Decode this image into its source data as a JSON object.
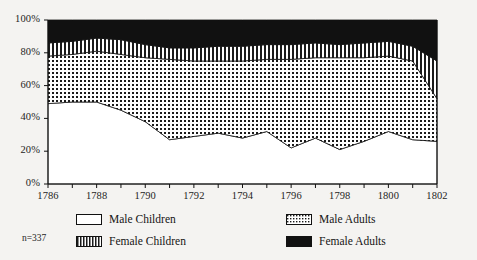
{
  "chart_data": {
    "type": "area",
    "title": "",
    "subtitle": "",
    "xlabel": "",
    "ylabel": "",
    "stacked": true,
    "normalized": true,
    "grid": false,
    "legend_position": "bottom",
    "xlim": [
      1786,
      1802
    ],
    "ylim": [
      0,
      100
    ],
    "ytick_labels": [
      "0%",
      "20%",
      "40%",
      "60%",
      "80%",
      "100%"
    ],
    "ytick_values": [
      0,
      20,
      40,
      60,
      80,
      100
    ],
    "xtick_labels": [
      "1786",
      "1788",
      "1790",
      "1792",
      "1794",
      "1796",
      "1798",
      "1800",
      "1802"
    ],
    "xtick_values": [
      1786,
      1788,
      1790,
      1792,
      1794,
      1796,
      1798,
      1800,
      1802
    ],
    "x": [
      1786,
      1787,
      1788,
      1789,
      1790,
      1791,
      1792,
      1793,
      1794,
      1795,
      1796,
      1797,
      1798,
      1799,
      1800,
      1801,
      1802
    ],
    "series": [
      {
        "name": "Male Children",
        "fill": "white",
        "values": [
          49,
          50,
          50,
          45,
          38,
          27,
          29,
          31,
          28,
          32,
          22,
          28,
          21,
          26,
          32,
          27,
          26
        ]
      },
      {
        "name": "Male Adults",
        "fill": "dots",
        "values": [
          29,
          29,
          31,
          34,
          39,
          49,
          46,
          44,
          47,
          44,
          54,
          49,
          56,
          51,
          46,
          48,
          26
        ]
      },
      {
        "name": "Female Children",
        "fill": "vertical-stripes",
        "values": [
          8,
          8,
          8,
          9,
          8,
          7,
          8,
          9,
          9,
          9,
          9,
          9,
          8,
          9,
          9,
          9,
          23
        ]
      },
      {
        "name": "Female Adults",
        "fill": "solid-black",
        "values": [
          14,
          13,
          11,
          12,
          15,
          17,
          17,
          16,
          16,
          15,
          15,
          14,
          15,
          14,
          13,
          16,
          25
        ]
      }
    ],
    "annotation": "n=337"
  },
  "legend": {
    "items": [
      {
        "label": "Male Children"
      },
      {
        "label": "Male Adults"
      },
      {
        "label": "Female Children"
      },
      {
        "label": "Female Adults"
      }
    ]
  },
  "annotation": {
    "sample_size": "n=337"
  },
  "colors": {
    "background": "#f4f3f1",
    "axis": "#111111",
    "text": "#141414",
    "solid_fill": "#111111",
    "white_fill": "#ffffff"
  }
}
